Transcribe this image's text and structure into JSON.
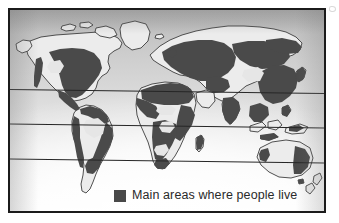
{
  "figure": {
    "kind": "world-population-distribution-map",
    "frame_border_color": "#1b1b1b",
    "paper_background_color": "#fbfbfb"
  },
  "legend": {
    "label": "Main areas where people live",
    "swatch_color": "#494949",
    "swatch_name": "populated-area-swatch"
  },
  "map": {
    "projection_hint": "world-mercator-like",
    "land_outline_color": "#3d3d3d",
    "populated_fill_color": "#4a4a4a",
    "sparse_fill_color": "#e9e9e9",
    "graticule_color": "#262626",
    "graticule_lines": [
      {
        "name": "tropic-of-cancer",
        "y_fraction": 0.405
      },
      {
        "name": "equator",
        "y_fraction": 0.578
      },
      {
        "name": "tropic-of-capricorn",
        "y_fraction": 0.752
      }
    ],
    "landmasses": [
      {
        "name": "north-america",
        "populated": true
      },
      {
        "name": "greenland",
        "populated": false
      },
      {
        "name": "south-america",
        "populated": true
      },
      {
        "name": "europe",
        "populated": true
      },
      {
        "name": "africa",
        "populated": true
      },
      {
        "name": "asia",
        "populated": true
      },
      {
        "name": "india",
        "populated": true
      },
      {
        "name": "southeast-asia-islands",
        "populated": true
      },
      {
        "name": "japan",
        "populated": true
      },
      {
        "name": "australia",
        "populated": true
      },
      {
        "name": "new-zealand",
        "populated": false
      }
    ]
  }
}
